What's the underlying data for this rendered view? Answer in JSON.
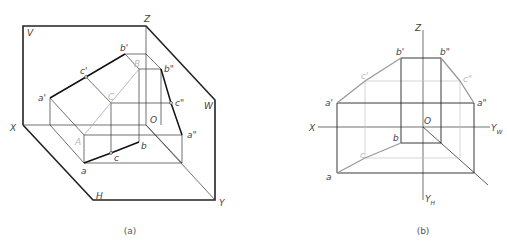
{
  "figure_a": {
    "caption": "(a)",
    "plane_labels": {
      "V": "V",
      "H": "H",
      "W": "W"
    },
    "axis_labels": {
      "X": "X",
      "Y": "Y",
      "Z": "Z",
      "O": "O"
    },
    "points": {
      "a_prime": "a'",
      "b_prime": "b'",
      "c_prime": "c'",
      "a_dprime": "a\"",
      "b_dprime": "b\"",
      "c_dprime": "c\"",
      "a": "a",
      "b": "b",
      "c": "c",
      "A": "A",
      "B": "B",
      "C": "C"
    }
  },
  "figure_b": {
    "caption": "(b)",
    "axis_labels": {
      "X": "X",
      "Z": "Z",
      "O": "O",
      "YW": "Y",
      "YW_sub": "W",
      "YH": "Y",
      "YH_sub": "H"
    },
    "points": {
      "a_prime": "a'",
      "b_prime": "b'",
      "c_prime": "c'",
      "a_dprime": "a\"",
      "b_dprime": "b\"",
      "c_dprime": "c\"",
      "a": "a",
      "b": "b",
      "c": "c"
    }
  },
  "colors": {
    "line": "#222222",
    "thin": "#333333",
    "faint": "#b8b8b8",
    "label": "#444444"
  }
}
